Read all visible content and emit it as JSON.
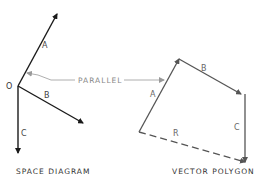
{
  "space_diagram": {
    "caption": "SPACE DIAGRAM",
    "origin_label": "O",
    "vectors": [
      {
        "label": "A",
        "from": [
          18,
          86
        ],
        "to": [
          57,
          14
        ]
      },
      {
        "label": "B",
        "from": [
          18,
          86
        ],
        "to": [
          83,
          123
        ]
      },
      {
        "label": "C",
        "from": [
          18,
          86
        ],
        "to": [
          18,
          153
        ]
      }
    ]
  },
  "vector_polygon": {
    "caption": "VECTOR POLYGON",
    "vectors": [
      {
        "label": "A",
        "from": [
          139,
          132
        ],
        "to": [
          179,
          59
        ]
      },
      {
        "label": "B",
        "from": [
          179,
          59
        ],
        "to": [
          241,
          94
        ]
      },
      {
        "label": "C",
        "from": [
          241,
          94
        ],
        "to": [
          245,
          162
        ]
      },
      {
        "label": "R",
        "from": [
          139,
          132
        ],
        "to": [
          245,
          162
        ],
        "style": "dashed"
      }
    ]
  },
  "annotation": {
    "text": "PARALLEL"
  },
  "colors": {
    "space_lines": "#1a1a1a",
    "polygon_lines": "#555555",
    "annotation": "#999999"
  }
}
